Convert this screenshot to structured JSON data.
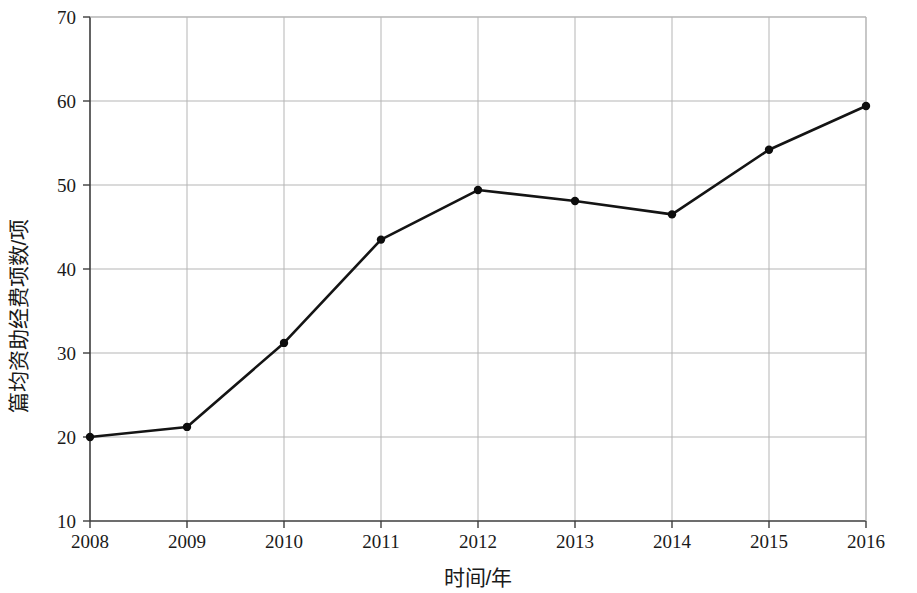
{
  "chart_data": {
    "type": "line",
    "title": "",
    "xlabel": "时间/年",
    "ylabel": "篇均资助经费项数/项",
    "categories": [
      "2008",
      "2009",
      "2010",
      "2011",
      "2012",
      "2013",
      "2014",
      "2015",
      "2016"
    ],
    "x": [
      2008,
      2009,
      2010,
      2011,
      2012,
      2013,
      2014,
      2015,
      2016
    ],
    "values": [
      20.0,
      21.2,
      31.2,
      43.5,
      49.4,
      48.1,
      46.5,
      54.2,
      59.4
    ],
    "series": [
      {
        "name": "篇均资助经费项数",
        "values": [
          20.0,
          21.2,
          31.2,
          43.5,
          49.4,
          48.1,
          46.5,
          54.2,
          59.4
        ]
      }
    ],
    "xlim": [
      2008,
      2016
    ],
    "ylim": [
      10,
      70
    ],
    "yticks": [
      10,
      20,
      30,
      40,
      50,
      60,
      70
    ],
    "ytick_labels": [
      "10",
      "20",
      "30",
      "40",
      "50",
      "60",
      "70"
    ],
    "xticks": [
      2008,
      2009,
      2010,
      2011,
      2012,
      2013,
      2014,
      2015,
      2016
    ],
    "xtick_labels": [
      "2008",
      "2009",
      "2010",
      "2011",
      "2012",
      "2013",
      "2014",
      "2015",
      "2016"
    ],
    "grid": true,
    "grid_color": "#b5b5b5",
    "legend": false,
    "legend_position": "none",
    "line_color": "#141414",
    "marker": "circle",
    "marker_color": "#0d0d0d",
    "background_color": "#ffffff",
    "axis_color": "#4a4a4a"
  }
}
